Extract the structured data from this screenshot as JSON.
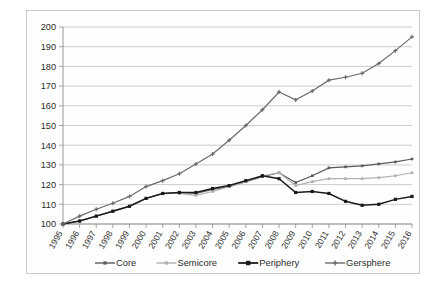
{
  "chart_data": {
    "type": "line",
    "title": "",
    "xlabel": "",
    "ylabel": "",
    "ylim": [
      100,
      200
    ],
    "ytick_step": 10,
    "ytick_labels": [
      "100",
      "110",
      "120",
      "130",
      "140",
      "150",
      "160",
      "170",
      "180",
      "190",
      "200"
    ],
    "grid": true,
    "legend_position": "bottom",
    "categories": [
      "1995",
      "1996",
      "1997",
      "1998",
      "1999",
      "2000",
      "2001",
      "2002",
      "2003",
      "2004",
      "2005",
      "2006",
      "2007",
      "2008",
      "2009",
      "2010",
      "2011",
      "2012",
      "2013",
      "2014",
      "2015",
      "2016"
    ],
    "series": [
      {
        "name": "Core",
        "color": "#5a5a5a",
        "marker": "square",
        "values": [
          100,
          101.5,
          104,
          106.5,
          109,
          113,
          115.5,
          116,
          115.5,
          117.5,
          119,
          121.5,
          124,
          126,
          121,
          124.5,
          128.5,
          129,
          129.5,
          130.5,
          131.5,
          133
        ]
      },
      {
        "name": "Semicore",
        "color": "#b0b0b0",
        "marker": "square",
        "values": [
          100,
          101.5,
          104,
          106.5,
          109,
          113,
          115.5,
          115.5,
          114.5,
          116.5,
          119,
          121.5,
          124.5,
          126,
          119.5,
          121.5,
          123,
          123,
          123,
          123.5,
          124.5,
          126
        ]
      },
      {
        "name": "Periphery",
        "color": "#1a1a1a",
        "marker": "square",
        "values": [
          100,
          101.5,
          104,
          106.5,
          109,
          113,
          115.5,
          116,
          116,
          118,
          119.5,
          122,
          124.5,
          123,
          116,
          116.5,
          115.5,
          111.5,
          109.5,
          110,
          112.5,
          114
        ]
      },
      {
        "name": "Gersphere",
        "color": "#6b6b6b",
        "marker": "plus",
        "values": [
          100,
          104,
          107.5,
          110.5,
          114,
          119,
          122,
          125.5,
          130.5,
          135.5,
          142.5,
          150,
          158,
          167,
          163,
          167.5,
          173,
          174.5,
          176.5,
          181.5,
          188,
          195
        ]
      }
    ]
  },
  "legend": {
    "items": [
      {
        "label": "Core"
      },
      {
        "label": "Semicore"
      },
      {
        "label": "Periphery"
      },
      {
        "label": "Gersphere"
      }
    ]
  }
}
